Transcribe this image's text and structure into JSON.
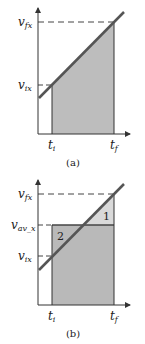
{
  "panels": [
    {
      "caption": "(a)",
      "y_labels": {
        "v_final": "v",
        "v_final_sub": "fx",
        "v_initial": "v",
        "v_initial_sub": "ix"
      },
      "x_labels": {
        "t_initial": "t",
        "t_initial_sub": "i",
        "t_final": "t",
        "t_final_sub": "f"
      }
    },
    {
      "caption": "(b)",
      "y_labels": {
        "v_final": "v",
        "v_final_sub": "fx",
        "v_average": "v",
        "v_average_sub": "av_x",
        "v_initial": "v",
        "v_initial_sub": "ix"
      },
      "x_labels": {
        "t_initial": "t",
        "t_initial_sub": "i",
        "t_final": "t",
        "t_final_sub": "f"
      },
      "regions": {
        "region_1": "1",
        "region_2": "2"
      }
    }
  ],
  "colors": {
    "shade_dark": "#b9b9b9",
    "shade_light": "#d9d9d9",
    "line": "#555555",
    "axis": "#333333"
  }
}
